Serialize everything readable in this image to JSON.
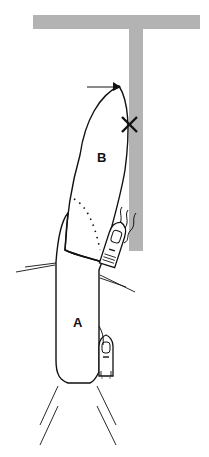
{
  "diagram": {
    "type": "boat-maneuver-illustration",
    "labels": {
      "area_a": "A",
      "area_b": "B"
    },
    "markers": {
      "collision_point": "×",
      "direction_arrow": "right"
    },
    "colors": {
      "wall": "#b3b3b3",
      "line": "#111111",
      "background": "#ffffff"
    }
  }
}
